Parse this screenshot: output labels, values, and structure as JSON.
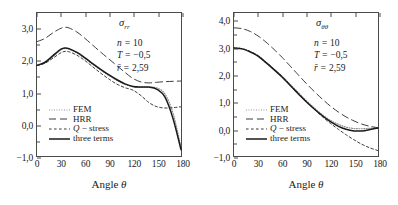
{
  "figure": {
    "panels": [
      {
        "id": "sigma-rr",
        "title_sym": "σ",
        "title_sub": "rr",
        "annotations": [
          {
            "lhs": "n",
            "eq": " = ",
            "rhs": "10"
          },
          {
            "lhs": "T",
            "eq": " = ",
            "rhs": "−0,5"
          },
          {
            "lhs": "r̄",
            "eq": " = ",
            "rhs": "2,59"
          }
        ],
        "xlabel": "Angle ",
        "xlabel_sym": "θ",
        "yticks": [
          "3,0",
          "2,0",
          "1,0",
          "0,0",
          "−1,0"
        ],
        "xticks": [
          "0",
          "30",
          "60",
          "90",
          "120",
          "150",
          "180"
        ],
        "legend": [
          {
            "label": "FEM",
            "style": "dotted"
          },
          {
            "label": "HRR",
            "style": "dashed"
          },
          {
            "label": "Q − stress",
            "style": "shortdash",
            "italic_prefix": "Q",
            "rest": " − stress"
          },
          {
            "label": "three terms",
            "style": "solid"
          }
        ]
      },
      {
        "id": "sigma-thetatheta",
        "title_sym": "σ",
        "title_sub": "θθ",
        "annotations": [
          {
            "lhs": "n",
            "eq": " = ",
            "rhs": "10"
          },
          {
            "lhs": "T",
            "eq": " = ",
            "rhs": "−0,5"
          },
          {
            "lhs": "r̄",
            "eq": " = ",
            "rhs": "2,59"
          }
        ],
        "xlabel": "Angle ",
        "xlabel_sym": "θ",
        "yticks": [
          "4,0",
          "3,0",
          "2,0",
          "1,0",
          "0,0",
          "−1,0"
        ],
        "xticks": [
          "0",
          "30",
          "60",
          "90",
          "120",
          "150",
          "180"
        ],
        "legend": [
          {
            "label": "FEM",
            "style": "dotted"
          },
          {
            "label": "HRR",
            "style": "dashed"
          },
          {
            "label": "Q − stress",
            "style": "shortdash",
            "italic_prefix": "Q",
            "rest": " − stress"
          },
          {
            "label": "three terms",
            "style": "solid"
          }
        ]
      }
    ]
  },
  "chart_data": [
    {
      "type": "line",
      "title": "σ_rr",
      "xlabel": "Angle θ",
      "ylabel": "",
      "xlim": [
        0,
        180
      ],
      "ylim": [
        -1.0,
        3.5
      ],
      "xticks": [
        0,
        30,
        60,
        90,
        120,
        150,
        180
      ],
      "yticks": [
        -1.0,
        0.0,
        1.0,
        2.0,
        3.0
      ],
      "grid": false,
      "legend_position": "lower-left",
      "annotations": [
        "n = 10",
        "T = −0,5",
        "r̄ = 2,59"
      ],
      "x": [
        0,
        10,
        20,
        30,
        35,
        40,
        50,
        60,
        70,
        80,
        90,
        100,
        110,
        120,
        130,
        140,
        150,
        160,
        170,
        180
      ],
      "series": [
        {
          "name": "FEM",
          "style": "dotted",
          "values": [
            1.85,
            1.93,
            2.13,
            2.34,
            2.38,
            2.36,
            2.24,
            2.07,
            1.88,
            1.7,
            1.53,
            1.38,
            1.25,
            1.18,
            1.16,
            1.17,
            1.14,
            0.95,
            0.35,
            -0.72
          ]
        },
        {
          "name": "HRR",
          "style": "dashed",
          "values": [
            2.6,
            2.7,
            2.88,
            3.02,
            3.05,
            3.03,
            2.9,
            2.7,
            2.48,
            2.26,
            2.05,
            1.84,
            1.63,
            1.44,
            1.33,
            1.3,
            1.32,
            1.34,
            1.35,
            1.36
          ]
        },
        {
          "name": "Q − stress",
          "style": "shortdash",
          "values": [
            1.85,
            1.92,
            2.08,
            2.25,
            2.29,
            2.28,
            2.17,
            2.0,
            1.8,
            1.6,
            1.42,
            1.26,
            1.15,
            1.07,
            0.9,
            0.68,
            0.55,
            0.51,
            0.52,
            0.55
          ]
        },
        {
          "name": "three terms",
          "style": "solid",
          "values": [
            1.85,
            1.95,
            2.16,
            2.36,
            2.4,
            2.38,
            2.26,
            2.09,
            1.9,
            1.72,
            1.55,
            1.4,
            1.27,
            1.19,
            1.17,
            1.17,
            1.1,
            0.85,
            0.18,
            -0.8
          ]
        }
      ]
    },
    {
      "type": "line",
      "title": "σ_θθ",
      "xlabel": "Angle θ",
      "ylabel": "",
      "xlim": [
        0,
        180
      ],
      "ylim": [
        -1.0,
        4.3
      ],
      "xticks": [
        0,
        30,
        60,
        90,
        120,
        150,
        180
      ],
      "yticks": [
        -1.0,
        0.0,
        1.0,
        2.0,
        3.0,
        4.0
      ],
      "grid": false,
      "legend_position": "lower-left",
      "annotations": [
        "n = 10",
        "T = −0,5",
        "r̄ = 2,59"
      ],
      "x": [
        0,
        10,
        20,
        30,
        40,
        50,
        60,
        70,
        80,
        90,
        100,
        110,
        120,
        130,
        140,
        150,
        160,
        170,
        180
      ],
      "series": [
        {
          "name": "FEM",
          "style": "dotted",
          "values": [
            3.0,
            2.98,
            2.88,
            2.72,
            2.48,
            2.22,
            1.96,
            1.66,
            1.36,
            1.06,
            0.79,
            0.54,
            0.33,
            0.18,
            0.07,
            0.02,
            0.01,
            0.03,
            0.05
          ]
        },
        {
          "name": "HRR",
          "style": "dashed",
          "values": [
            3.75,
            3.72,
            3.62,
            3.45,
            3.22,
            2.95,
            2.66,
            2.34,
            2.02,
            1.7,
            1.4,
            1.12,
            0.86,
            0.64,
            0.45,
            0.3,
            0.18,
            0.1,
            0.05
          ]
        },
        {
          "name": "Q − stress",
          "style": "shortdash",
          "values": [
            3.0,
            2.98,
            2.88,
            2.72,
            2.48,
            2.22,
            1.95,
            1.64,
            1.33,
            1.03,
            0.74,
            0.47,
            0.22,
            0.0,
            -0.21,
            -0.4,
            -0.57,
            -0.7,
            -0.8
          ]
        },
        {
          "name": "three terms",
          "style": "solid",
          "values": [
            3.0,
            2.97,
            2.86,
            2.7,
            2.46,
            2.2,
            1.93,
            1.62,
            1.32,
            1.02,
            0.75,
            0.5,
            0.28,
            0.11,
            -0.01,
            -0.07,
            -0.07,
            -0.02,
            0.04
          ]
        }
      ]
    }
  ]
}
